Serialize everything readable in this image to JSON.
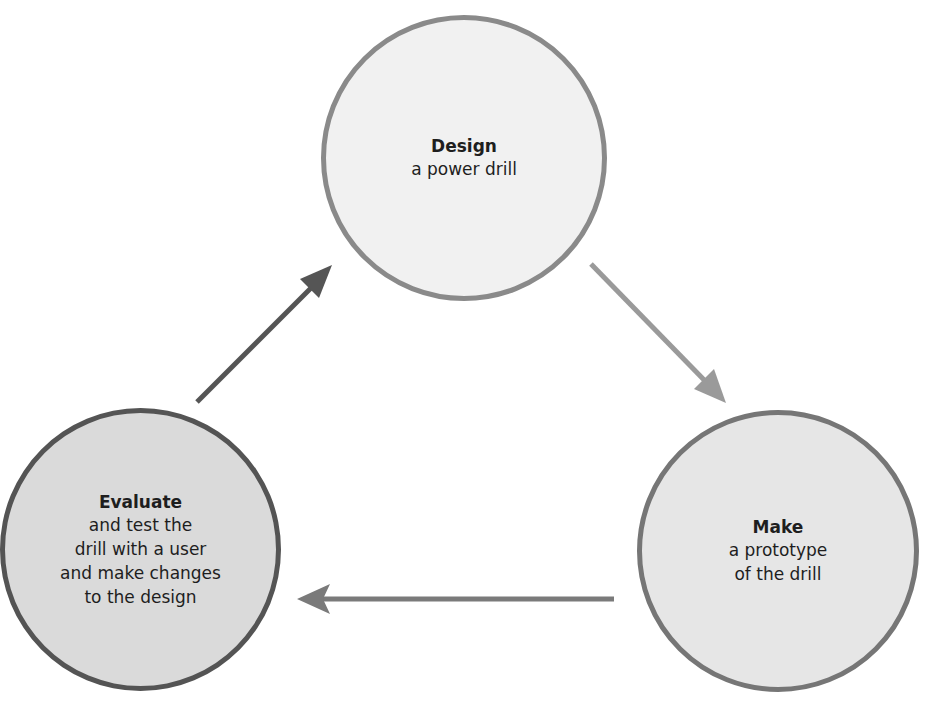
{
  "diagram": {
    "type": "cycle",
    "nodes": [
      {
        "id": "design",
        "title": "Design",
        "desc": "a power drill",
        "fill": "#f1f1f1",
        "border": "#8a8a8a"
      },
      {
        "id": "make",
        "title": "Make",
        "desc": "a prototype\nof the drill",
        "fill": "#e6e6e6",
        "border": "#767676"
      },
      {
        "id": "evaluate",
        "title": "Evaluate",
        "desc": "and test the\ndrill with a user\nand make changes\nto the design",
        "fill": "#dadada",
        "border": "#545454"
      }
    ],
    "edges": [
      {
        "from": "design",
        "to": "make",
        "color": "#9a9a9a"
      },
      {
        "from": "make",
        "to": "evaluate",
        "color": "#7a7a7a"
      },
      {
        "from": "evaluate",
        "to": "design",
        "color": "#555555"
      }
    ]
  }
}
